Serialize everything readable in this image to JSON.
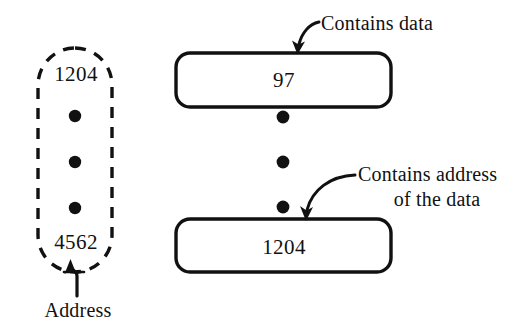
{
  "diagram": {
    "colors": {
      "ink": "#111111",
      "background": "#ffffff"
    },
    "memory_block": {
      "name": "address-column",
      "border_style": "dashed",
      "shape": "rounded-pill",
      "top_address": "1204",
      "bottom_address": "4562",
      "ellipsis_dots": 3,
      "caption": "Address"
    },
    "boxes": [
      {
        "name": "data-box",
        "value": "97",
        "annotation": "Contains data",
        "border_style": "solid",
        "shape": "rounded-rect"
      },
      {
        "name": "pointer-box",
        "value": "1204",
        "annotation_line1": "Contains address",
        "annotation_line2": "of the data",
        "border_style": "solid",
        "shape": "rounded-rect"
      }
    ],
    "between_boxes_dots": 3,
    "icons": {
      "address_arrow": "arrow-up-icon",
      "data_arrow": "curved-arrow-icon",
      "pointer_arrow": "curved-arrow-icon",
      "dot": "bullet-dot-icon"
    }
  }
}
